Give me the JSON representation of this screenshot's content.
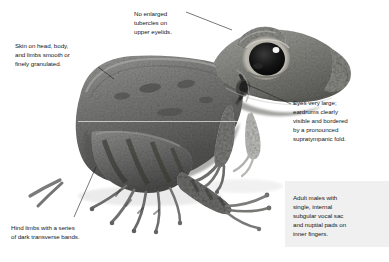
{
  "figure": {
    "kind": "annotated-photograph",
    "background_color": "#ffffff",
    "panel_color": "#f0f0f0",
    "text_color": "#15171a",
    "leader_color": "#1b1d20"
  },
  "callouts": {
    "tubercles": "No enlarged\ntubercles on\nupper eyelids.",
    "skin": "Skin on head, body,\nand limbs smooth or\nfinely granulated.",
    "eyes": "Eyes very large;\neardrums clearly\nvisible and bordered\nby a pronounced\nsupratympanic fold.",
    "males": "Adult males with\nsingle, internal\nsubgular vocal sac\nand nuptial pads on\ninner fingers.",
    "hind_limbs": "Hind limbs with a series\nof dark transverse bands."
  }
}
